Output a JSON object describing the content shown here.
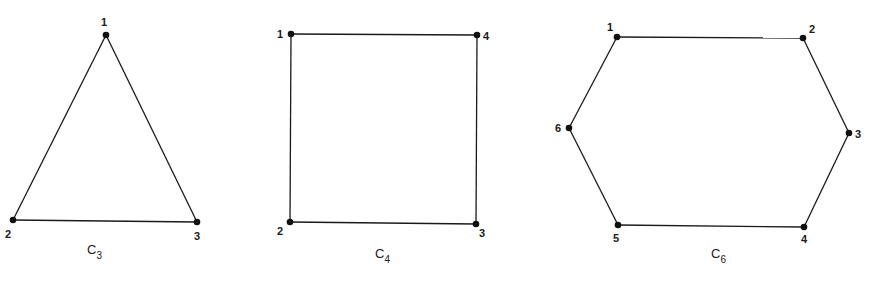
{
  "graphs": [
    {
      "name": "C",
      "subscript": "3",
      "label_pos": [
        87,
        254
      ],
      "vertices": [
        {
          "id": "1",
          "x": 106,
          "y": 35,
          "lx": 101,
          "ly": 26
        },
        {
          "id": "2",
          "x": 13,
          "y": 220,
          "lx": 5,
          "ly": 238
        },
        {
          "id": "3",
          "x": 197,
          "y": 222,
          "lx": 194,
          "ly": 240
        }
      ],
      "edges": [
        [
          "1",
          "2"
        ],
        [
          "2",
          "3"
        ],
        [
          "3",
          "1"
        ]
      ]
    },
    {
      "name": "C",
      "subscript": "4",
      "label_pos": [
        375,
        258
      ],
      "vertices": [
        {
          "id": "1",
          "x": 291,
          "y": 34,
          "lx": 277,
          "ly": 38
        },
        {
          "id": "4",
          "x": 477,
          "y": 35,
          "lx": 483,
          "ly": 40
        },
        {
          "id": "3",
          "x": 476,
          "y": 224,
          "lx": 479,
          "ly": 237
        },
        {
          "id": "2",
          "x": 290,
          "y": 222,
          "lx": 277,
          "ly": 235
        }
      ],
      "edges": [
        [
          "1",
          "4"
        ],
        [
          "4",
          "3"
        ],
        [
          "3",
          "2"
        ],
        [
          "2",
          "1"
        ]
      ]
    },
    {
      "name": "C",
      "subscript": "6",
      "label_pos": [
        711,
        258
      ],
      "vertices": [
        {
          "id": "1",
          "x": 617,
          "y": 37,
          "lx": 607,
          "ly": 31
        },
        {
          "id": "2",
          "x": 803,
          "y": 38,
          "lx": 809,
          "ly": 33
        },
        {
          "id": "3",
          "x": 849,
          "y": 133,
          "lx": 855,
          "ly": 138
        },
        {
          "id": "4",
          "x": 804,
          "y": 227,
          "lx": 801,
          "ly": 243
        },
        {
          "id": "5",
          "x": 618,
          "y": 225,
          "lx": 613,
          "ly": 242
        },
        {
          "id": "6",
          "x": 569,
          "y": 128,
          "lx": 555,
          "ly": 132
        }
      ],
      "edges": [
        [
          "1",
          "2"
        ],
        [
          "2",
          "3"
        ],
        [
          "3",
          "4"
        ],
        [
          "4",
          "5"
        ],
        [
          "5",
          "6"
        ],
        [
          "6",
          "1"
        ]
      ]
    }
  ],
  "colors": {
    "stroke": "#1a1a1a",
    "vertex": "#111111",
    "background": "#ffffff"
  }
}
